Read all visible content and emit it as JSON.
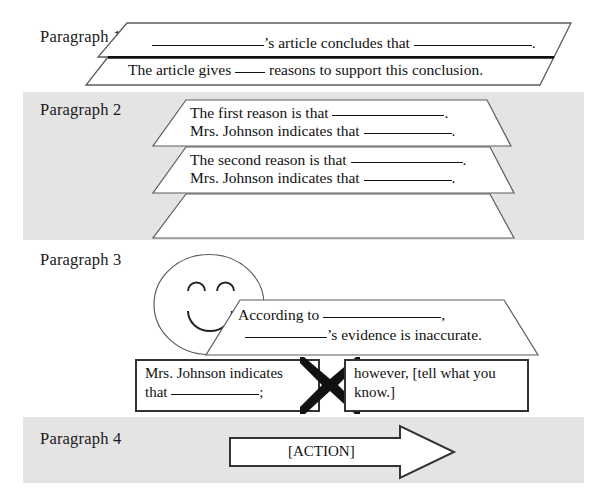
{
  "document": {
    "title": "Paragraph Frame Graphic Organizer",
    "background_color": "#ffffff",
    "band_color": "#e4e4e4",
    "ink_color": "#111111"
  },
  "sections": [
    {
      "id": "paragraph-1",
      "label": "Paragraph 1",
      "banded": false,
      "shapes": [
        {
          "kind": "trapezoid",
          "lines": [
            {
              "parts": [
                "blank",
                "'s article concludes that ",
                "blank",
                "."
              ]
            }
          ]
        },
        {
          "kind": "trapezoid",
          "lines": [
            {
              "parts": [
                "The article gives ",
                "blank",
                " reasons to support this conclusion."
              ]
            }
          ]
        }
      ]
    },
    {
      "id": "paragraph-2",
      "label": "Paragraph 2",
      "banded": true,
      "shapes": [
        {
          "kind": "trapezoid",
          "lines": [
            {
              "parts": [
                "The first reason is that ",
                "blank",
                "."
              ]
            },
            {
              "parts": [
                "Mrs. Johnson indicates that ",
                "blank",
                "."
              ]
            }
          ]
        },
        {
          "kind": "trapezoid",
          "lines": [
            {
              "parts": [
                "The second reason is that ",
                "blank",
                "."
              ]
            },
            {
              "parts": [
                "Mrs. Johnson indicates that ",
                "blank",
                "."
              ]
            }
          ]
        },
        {
          "kind": "trapezoid",
          "lines": []
        }
      ]
    },
    {
      "id": "paragraph-3",
      "label": "Paragraph 3",
      "banded": false,
      "shapes": [
        {
          "kind": "smiley-face",
          "lines": []
        },
        {
          "kind": "trapezoid",
          "lines": [
            {
              "parts": [
                "According to ",
                "blank",
                ","
              ]
            },
            {
              "parts": [
                "blank",
                "'s evidence is inaccurate."
              ]
            }
          ]
        },
        {
          "kind": "box-left",
          "lines": [
            {
              "parts": [
                "Mrs. Johnson indicates"
              ]
            },
            {
              "parts": [
                "that ",
                "blank",
                ";"
              ]
            }
          ]
        },
        {
          "kind": "x-connector",
          "lines": []
        },
        {
          "kind": "box-right",
          "lines": [
            {
              "parts": [
                "however, [tell what you"
              ]
            },
            {
              "parts": [
                "know.]"
              ]
            }
          ]
        }
      ]
    },
    {
      "id": "paragraph-4",
      "label": "Paragraph 4",
      "banded": true,
      "shapes": [
        {
          "kind": "block-arrow",
          "lines": [
            {
              "parts": [
                "[ACTION]"
              ]
            }
          ]
        }
      ]
    }
  ],
  "text": {
    "para1_label": "Paragraph 1",
    "para2_label": "Paragraph 2",
    "para3_label": "Paragraph 3",
    "para4_label": "Paragraph 4",
    "p1_line1_a": "’s article concludes that",
    "p1_line1_b": ".",
    "p1_line2_a": "The article gives",
    "p1_line2_b": "reasons to support this conclusion.",
    "p2_a_line1": "The first reason is that",
    "p2_a_line1_end": ".",
    "p2_a_line2": "Mrs. Johnson indicates that",
    "p2_a_line2_end": ".",
    "p2_b_line1": "The second reason is that",
    "p2_b_line1_end": ".",
    "p2_b_line2": "Mrs. Johnson indicates that",
    "p2_b_line2_end": ".",
    "p3_line1": "According to",
    "p3_line1_end": ",",
    "p3_line2_end": "’s evidence is inaccurate.",
    "p3_box_left_l1": "Mrs. Johnson indicates",
    "p3_box_left_l2a": "that",
    "p3_box_left_l2b": ";",
    "p3_box_right_l1": "however, [tell what you",
    "p3_box_right_l2": "know.]",
    "p4_arrow_label": "[ACTION]"
  }
}
